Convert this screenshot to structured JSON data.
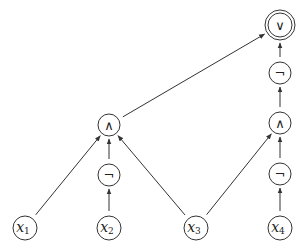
{
  "diagram": {
    "colors": {
      "stroke": "#333333",
      "background": "#ffffff",
      "text": "#222222"
    },
    "nodes": [
      {
        "id": "out",
        "label": "∨",
        "kind": "operator",
        "output": true,
        "x": 280,
        "y": 25,
        "r": 15
      },
      {
        "id": "notR1",
        "label": "¬",
        "kind": "operator",
        "output": false,
        "x": 280,
        "y": 73,
        "r": 11
      },
      {
        "id": "andR",
        "label": "∧",
        "kind": "operator",
        "output": false,
        "x": 280,
        "y": 123,
        "r": 11
      },
      {
        "id": "notR2",
        "label": "¬",
        "kind": "operator",
        "output": false,
        "x": 280,
        "y": 174,
        "r": 11
      },
      {
        "id": "andL",
        "label": "∧",
        "kind": "operator",
        "output": false,
        "x": 109,
        "y": 125,
        "r": 11
      },
      {
        "id": "notL",
        "label": "¬",
        "kind": "operator",
        "output": false,
        "x": 109,
        "y": 175,
        "r": 11
      },
      {
        "id": "x1",
        "label": "x",
        "sub": "1",
        "kind": "input",
        "x": 25,
        "y": 228,
        "r": 12
      },
      {
        "id": "x2",
        "label": "x",
        "sub": "2",
        "kind": "input",
        "x": 109,
        "y": 228,
        "r": 12
      },
      {
        "id": "x3",
        "label": "x",
        "sub": "3",
        "kind": "input",
        "x": 196,
        "y": 228,
        "r": 12
      },
      {
        "id": "x4",
        "label": "x",
        "sub": "4",
        "kind": "input",
        "x": 280,
        "y": 228,
        "r": 12
      }
    ],
    "edges": [
      {
        "from": "x1",
        "to": "andL"
      },
      {
        "from": "x2",
        "to": "notL"
      },
      {
        "from": "notL",
        "to": "andL"
      },
      {
        "from": "x3",
        "to": "andL"
      },
      {
        "from": "x3",
        "to": "andR"
      },
      {
        "from": "x4",
        "to": "notR2"
      },
      {
        "from": "notR2",
        "to": "andR"
      },
      {
        "from": "andR",
        "to": "notR1"
      },
      {
        "from": "notR1",
        "to": "out"
      },
      {
        "from": "andL",
        "to": "out"
      }
    ]
  }
}
